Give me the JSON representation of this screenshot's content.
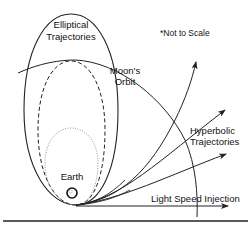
{
  "diagram": {
    "labels": {
      "elliptical_line1": "Elliptical",
      "elliptical_line2": "Trajectories",
      "not_to_scale": "*Not to Scale",
      "moon_line1": "Moon's",
      "moon_line2": "Orbit",
      "hyperbolic_line1": "Hyperbolic",
      "hyperbolic_line2": "Trajectories",
      "earth": "Earth",
      "light_speed": "Light Speed Injection"
    },
    "ellipses": [
      {
        "name": "outer-elliptical-trajectory",
        "style": "solid"
      },
      {
        "name": "dashed-elliptical-trajectory",
        "style": "dashed"
      },
      {
        "name": "dotted-elliptical-trajectory",
        "style": "dotted"
      }
    ],
    "hyperbolic_trajectories": 3,
    "colors": {
      "line": "#222222",
      "dotted": "#888888",
      "background": "#ffffff"
    }
  }
}
